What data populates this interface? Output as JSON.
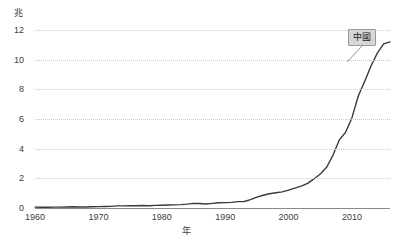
{
  "chart_data": {
    "type": "line",
    "title": "",
    "subtitle": "",
    "xlabel": "年",
    "ylabel": "兆",
    "grid": true,
    "legend_position": "inline-right",
    "xlim": [
      1960,
      2016
    ],
    "ylim": [
      0,
      12
    ],
    "xticks": [
      "1960",
      "1970",
      "1980",
      "1990",
      "2000",
      "2010"
    ],
    "xtick_values": [
      1960,
      1970,
      1980,
      1990,
      2000,
      2010
    ],
    "yticks": [
      "0",
      "2",
      "4",
      "6",
      "8",
      "10",
      "12"
    ],
    "ytick_values": [
      0,
      2,
      4,
      6,
      8,
      10,
      12
    ],
    "series": [
      {
        "name": "中國",
        "color": "#3a3a3a",
        "x": [
          1960,
          1961,
          1962,
          1963,
          1964,
          1965,
          1966,
          1967,
          1968,
          1969,
          1970,
          1971,
          1972,
          1973,
          1974,
          1975,
          1976,
          1977,
          1978,
          1979,
          1980,
          1981,
          1982,
          1983,
          1984,
          1985,
          1986,
          1987,
          1988,
          1989,
          1990,
          1991,
          1992,
          1993,
          1994,
          1995,
          1996,
          1997,
          1998,
          1999,
          2000,
          2001,
          2002,
          2003,
          2004,
          2005,
          2006,
          2007,
          2008,
          2009,
          2010,
          2011,
          2012,
          2013,
          2014,
          2015,
          2016
        ],
        "values": [
          0.06,
          0.05,
          0.05,
          0.06,
          0.06,
          0.07,
          0.08,
          0.07,
          0.07,
          0.08,
          0.09,
          0.1,
          0.11,
          0.14,
          0.14,
          0.16,
          0.15,
          0.17,
          0.15,
          0.18,
          0.19,
          0.2,
          0.21,
          0.23,
          0.26,
          0.31,
          0.3,
          0.27,
          0.31,
          0.35,
          0.36,
          0.38,
          0.43,
          0.44,
          0.56,
          0.73,
          0.86,
          0.96,
          1.03,
          1.09,
          1.21,
          1.34,
          1.47,
          1.66,
          1.96,
          2.29,
          2.75,
          3.55,
          4.59,
          5.11,
          6.09,
          7.55,
          8.53,
          9.57,
          10.44,
          11.06,
          11.2
        ]
      }
    ]
  },
  "series_label": {
    "text": "中國"
  },
  "axis_units": {
    "y_unit": "兆",
    "x_unit": "年"
  }
}
